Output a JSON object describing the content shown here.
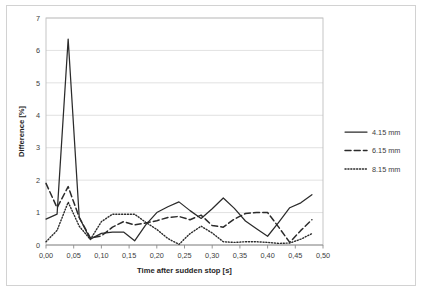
{
  "chart_data": {
    "type": "line",
    "title": "",
    "xlabel": "Time after sudden stop [s]",
    "ylabel": "Difference [%]",
    "xlim": [
      0.0,
      0.5
    ],
    "ylim": [
      0,
      7
    ],
    "xticks": [
      "0,00",
      "0,05",
      "0,10",
      "0,15",
      "0,20",
      "0,25",
      "0,30",
      "0,35",
      "0,40",
      "0,45",
      "0,50"
    ],
    "xtick_values": [
      0.0,
      0.05,
      0.1,
      0.15,
      0.2,
      0.25,
      0.3,
      0.35,
      0.4,
      0.45,
      0.5
    ],
    "yticks": [
      "0",
      "1",
      "2",
      "3",
      "4",
      "5",
      "6",
      "7"
    ],
    "ytick_values": [
      0,
      1,
      2,
      3,
      4,
      5,
      6,
      7
    ],
    "grid": "horizontal",
    "legend_position": "right",
    "x": [
      0.0,
      0.02,
      0.04,
      0.06,
      0.08,
      0.1,
      0.12,
      0.14,
      0.16,
      0.18,
      0.2,
      0.22,
      0.24,
      0.26,
      0.28,
      0.3,
      0.32,
      0.34,
      0.36,
      0.38,
      0.4,
      0.42,
      0.44,
      0.46,
      0.48
    ],
    "series": [
      {
        "name": "4.15 mm",
        "style": "solid",
        "values": [
          0.8,
          0.95,
          6.35,
          0.85,
          0.18,
          0.36,
          0.4,
          0.4,
          0.13,
          0.62,
          1.0,
          1.18,
          1.33,
          1.06,
          0.82,
          1.12,
          1.45,
          1.13,
          0.74,
          0.5,
          0.27,
          0.7,
          1.15,
          1.3,
          1.55
        ]
      },
      {
        "name": "6.15 mm",
        "style": "dashed",
        "values": [
          1.9,
          1.15,
          1.8,
          0.85,
          0.22,
          0.28,
          0.55,
          0.72,
          0.62,
          0.68,
          0.75,
          0.85,
          0.88,
          0.78,
          0.92,
          0.6,
          0.55,
          0.8,
          0.97,
          1.0,
          1.0,
          0.55,
          0.08,
          0.45,
          0.78
        ]
      },
      {
        "name": "8.15 mm",
        "style": "dotted",
        "values": [
          0.1,
          0.45,
          1.32,
          0.58,
          0.17,
          0.72,
          0.95,
          0.95,
          0.95,
          0.7,
          0.48,
          0.2,
          0.02,
          0.35,
          0.58,
          0.37,
          0.1,
          0.08,
          0.1,
          0.1,
          0.08,
          0.05,
          0.06,
          0.18,
          0.35
        ]
      }
    ]
  },
  "legend": {
    "entries": [
      {
        "label": "4.15 mm",
        "style": "solid"
      },
      {
        "label": "6.15 mm",
        "style": "dashed"
      },
      {
        "label": "8.15 mm",
        "style": "dotted"
      }
    ]
  },
  "colors": {
    "series": "#2b2b2b",
    "grid": "#d9d9d9",
    "frame": "#d2d2d2",
    "text": "#3d3d3d"
  }
}
